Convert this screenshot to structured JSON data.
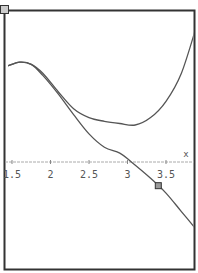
{
  "chart_data": {
    "type": "line",
    "title": "",
    "xlabel": "x",
    "ylabel": "",
    "xlim": [
      1.45,
      3.95
    ],
    "x_ticks": [
      "1.5",
      "2",
      "2.5",
      "3",
      "3.5"
    ],
    "grid": false,
    "legend": null,
    "series": [
      {
        "name": "curve-1",
        "color": "#555555",
        "points": [
          [
            1.45,
            1.3
          ],
          [
            1.6,
            1.35
          ],
          [
            1.75,
            1.32
          ],
          [
            1.9,
            1.2
          ],
          [
            2.1,
            0.95
          ],
          [
            2.3,
            0.72
          ],
          [
            2.5,
            0.6
          ],
          [
            2.7,
            0.55
          ],
          [
            2.9,
            0.52
          ],
          [
            3.1,
            0.5
          ],
          [
            3.3,
            0.6
          ],
          [
            3.5,
            0.82
          ],
          [
            3.7,
            1.2
          ],
          [
            3.9,
            1.85
          ]
        ]
      },
      {
        "name": "curve-2",
        "color": "#555555",
        "points": [
          [
            1.45,
            1.3
          ],
          [
            1.6,
            1.35
          ],
          [
            1.75,
            1.32
          ],
          [
            1.9,
            1.17
          ],
          [
            2.1,
            0.92
          ],
          [
            2.3,
            0.64
          ],
          [
            2.5,
            0.38
          ],
          [
            2.7,
            0.2
          ],
          [
            2.9,
            0.12
          ],
          [
            3.05,
            0.0
          ],
          [
            3.3,
            -0.22
          ],
          [
            3.5,
            -0.42
          ],
          [
            3.7,
            -0.67
          ],
          [
            3.9,
            -0.92
          ]
        ]
      }
    ],
    "trace_cursor": {
      "x": 3.4,
      "series": "curve-2"
    }
  },
  "ui": {
    "corner_box_label": "Z"
  }
}
